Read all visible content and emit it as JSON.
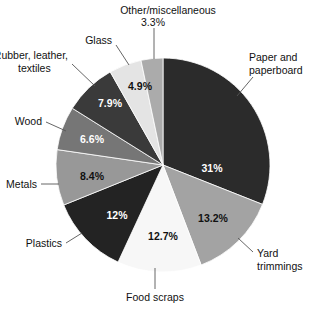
{
  "chart_data": {
    "type": "pie",
    "title": "",
    "subtitle": "",
    "xlabel": "",
    "ylabel": "",
    "legend_position": "none",
    "grid": false,
    "units": "percent",
    "start_angle_deg": 0,
    "direction": "clockwise",
    "categories": [
      "Paper and paperboard",
      "Yard trimmings",
      "Food scraps",
      "Plastics",
      "Metals",
      "Wood",
      "Rubber, leather, textiles",
      "Glass",
      "Other/miscellaneous"
    ],
    "values": [
      31,
      13.2,
      12.7,
      12,
      8.4,
      6.6,
      7.9,
      4.9,
      3.3
    ],
    "value_labels": [
      "31%",
      "13.2%",
      "12.7%",
      "12%",
      "8.4%",
      "6.6%",
      "7.9%",
      "4.9%",
      "3.3%"
    ],
    "colors": [
      "#2b2b2b",
      "#a3a3a3",
      "#f7f7f7",
      "#232323",
      "#989898",
      "#767676",
      "#3a3a3a",
      "#e4e4e4",
      "#ababab"
    ],
    "label_text_colors": [
      "#ffffff",
      "#111111",
      "#111111",
      "#ffffff",
      "#111111",
      "#ffffff",
      "#ffffff",
      "#111111",
      "#111111"
    ],
    "slices": [
      {
        "label": "Paper and paperboard",
        "value": 31,
        "value_label": "31%",
        "color": "#2b2b2b",
        "label_color": "#ffffff"
      },
      {
        "label": "Yard trimmings",
        "value": 13.2,
        "value_label": "13.2%",
        "color": "#a3a3a3",
        "label_color": "#111111"
      },
      {
        "label": "Food scraps",
        "value": 12.7,
        "value_label": "12.7%",
        "color": "#f7f7f7",
        "label_color": "#111111"
      },
      {
        "label": "Plastics",
        "value": 12,
        "value_label": "12%",
        "color": "#232323",
        "label_color": "#ffffff"
      },
      {
        "label": "Metals",
        "value": 8.4,
        "value_label": "8.4%",
        "color": "#989898",
        "label_color": "#111111"
      },
      {
        "label": "Wood",
        "value": 6.6,
        "value_label": "6.6%",
        "color": "#767676",
        "label_color": "#ffffff"
      },
      {
        "label": "Rubber, leather, textiles",
        "value": 7.9,
        "value_label": "7.9%",
        "color": "#3a3a3a",
        "label_color": "#ffffff"
      },
      {
        "label": "Glass",
        "value": 4.9,
        "value_label": "4.9%",
        "color": "#e4e4e4",
        "label_color": "#111111"
      },
      {
        "label": "Other/miscellaneous",
        "value": 3.3,
        "value_label": "3.3%",
        "color": "#ababab",
        "label_color": "#111111"
      }
    ]
  },
  "labels": {
    "paper_line1": "Paper and",
    "paper_line2": "paperboard",
    "yard_line1": "Yard",
    "yard_line2": "trimmings",
    "food": "Food scraps",
    "plastics": "Plastics",
    "metals": "Metals",
    "wood": "Wood",
    "rubber_line1": "Rubber, leather,",
    "rubber_line2": "textiles",
    "glass": "Glass",
    "other_line1": "Other/miscellaneous",
    "other_line2": "3.3%"
  },
  "pct": {
    "paper": "31%",
    "yard": "13.2%",
    "food": "12.7%",
    "plastics": "12%",
    "metals": "8.4%",
    "wood": "6.6%",
    "rubber": "7.9%",
    "glass": "4.9%"
  }
}
